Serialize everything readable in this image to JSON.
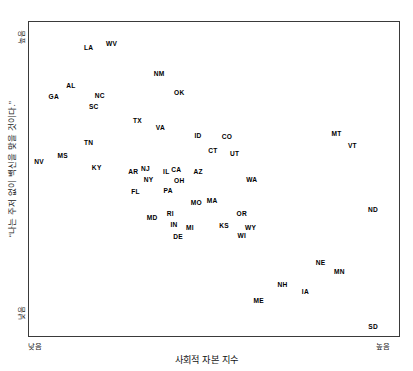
{
  "chart_data": {
    "type": "scatter",
    "title": "",
    "xlabel": "사회적 자본 지수",
    "ylabel": "“나는 주저 없이 백신을 맞을 것이다.”",
    "x_tick_labels": [
      "낮음",
      "높음"
    ],
    "y_tick_labels": [
      "낮음",
      "높음"
    ],
    "xlim": [
      0,
      100
    ],
    "ylim": [
      0,
      100
    ],
    "grid": false,
    "legend": "none",
    "point_marker": "text-label-only",
    "note": "Each data point is rendered as its two-letter US state abbreviation; x/y are percent positions inside the plot frame measured from the screenshot (x: left=0 to right=100, y: bottom=0 to top=100).",
    "points": [
      {
        "label": "LA",
        "x": 16.1,
        "y": 91.8
      },
      {
        "label": "WV",
        "x": 22.3,
        "y": 93.0
      },
      {
        "label": "NM",
        "x": 35.2,
        "y": 83.5
      },
      {
        "label": "AL",
        "x": 11.3,
        "y": 79.7
      },
      {
        "label": "GA",
        "x": 6.7,
        "y": 76.0
      },
      {
        "label": "NC",
        "x": 19.1,
        "y": 76.3
      },
      {
        "label": "SC",
        "x": 17.5,
        "y": 72.8
      },
      {
        "label": "OK",
        "x": 40.6,
        "y": 77.5
      },
      {
        "label": "TX",
        "x": 29.3,
        "y": 68.4
      },
      {
        "label": "VA",
        "x": 35.5,
        "y": 66.1
      },
      {
        "label": "ID",
        "x": 45.7,
        "y": 63.6
      },
      {
        "label": "CO",
        "x": 53.5,
        "y": 63.3
      },
      {
        "label": "MT",
        "x": 83.1,
        "y": 64.2
      },
      {
        "label": "VT",
        "x": 87.4,
        "y": 60.4
      },
      {
        "label": "TN",
        "x": 16.1,
        "y": 61.4
      },
      {
        "label": "MS",
        "x": 9.1,
        "y": 57.3
      },
      {
        "label": "NV",
        "x": 2.7,
        "y": 55.4
      },
      {
        "label": "CT",
        "x": 49.7,
        "y": 58.9
      },
      {
        "label": "UT",
        "x": 55.6,
        "y": 57.9
      },
      {
        "label": "KY",
        "x": 18.3,
        "y": 53.5
      },
      {
        "label": "AR",
        "x": 28.2,
        "y": 52.2
      },
      {
        "label": "NJ",
        "x": 31.5,
        "y": 53.2
      },
      {
        "label": "IL",
        "x": 37.1,
        "y": 52.2
      },
      {
        "label": "CA",
        "x": 39.8,
        "y": 52.8
      },
      {
        "label": "AZ",
        "x": 45.7,
        "y": 52.2
      },
      {
        "label": "NY",
        "x": 32.3,
        "y": 49.7
      },
      {
        "label": "OH",
        "x": 40.6,
        "y": 49.4
      },
      {
        "label": "WA",
        "x": 60.2,
        "y": 49.7
      },
      {
        "label": "FL",
        "x": 28.8,
        "y": 45.9
      },
      {
        "label": "PA",
        "x": 37.6,
        "y": 46.2
      },
      {
        "label": "MO",
        "x": 45.2,
        "y": 42.4
      },
      {
        "label": "MA",
        "x": 49.5,
        "y": 43.0
      },
      {
        "label": "OR",
        "x": 57.5,
        "y": 38.9
      },
      {
        "label": "ND",
        "x": 93.0,
        "y": 40.2
      },
      {
        "label": "MD",
        "x": 33.3,
        "y": 37.7
      },
      {
        "label": "RI",
        "x": 38.2,
        "y": 38.9
      },
      {
        "label": "IN",
        "x": 39.2,
        "y": 35.4
      },
      {
        "label": "MI",
        "x": 43.5,
        "y": 34.5
      },
      {
        "label": "KS",
        "x": 52.7,
        "y": 35.1
      },
      {
        "label": "WY",
        "x": 59.9,
        "y": 34.5
      },
      {
        "label": "WI",
        "x": 57.5,
        "y": 32.0
      },
      {
        "label": "DE",
        "x": 40.3,
        "y": 31.6
      },
      {
        "label": "NE",
        "x": 78.8,
        "y": 23.4
      },
      {
        "label": "MN",
        "x": 83.9,
        "y": 20.3
      },
      {
        "label": "NH",
        "x": 68.5,
        "y": 16.1
      },
      {
        "label": "IA",
        "x": 74.7,
        "y": 13.9
      },
      {
        "label": "ME",
        "x": 62.1,
        "y": 11.1
      },
      {
        "label": "SD",
        "x": 93.0,
        "y": 2.8
      }
    ]
  },
  "axes": {
    "x_title": "사회적 자본 지수",
    "x_low": "낮음",
    "x_high": "높음",
    "y_title": "“나는 주저 없이 백신을 맞을 것이다.”",
    "y_low": "낮음",
    "y_high": "높음"
  }
}
